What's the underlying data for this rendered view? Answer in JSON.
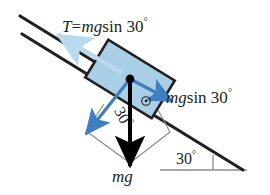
{
  "figure": {
    "name": "inclined-plane-free-body-diagram",
    "background_color": "#ffffff"
  },
  "labels": {
    "tension": {
      "symbol": "T",
      "equals": "=",
      "mass_gravity": "mg",
      "trig": "sin 30",
      "degree": "°",
      "full_text": "T = mg sin 30 °"
    },
    "component_along_incline": {
      "mass_gravity": "mg",
      "trig": "sin 30",
      "degree": "°",
      "full_text": "mg sin 30 °"
    },
    "weight": {
      "full_text": "mg"
    },
    "angle_inner": {
      "value": "30",
      "degree": "°",
      "full_text": "30 °"
    },
    "angle_base": {
      "value": "30",
      "degree": "°",
      "full_text": "30 °"
    }
  },
  "colors": {
    "block_fill": "#a9cfe7",
    "block_stroke": "#231f20",
    "incline_line": "#231f20",
    "weight_arrow": "#000000",
    "tension_arrow": "#b9d9ee",
    "component_arrow": "#3f7fbf",
    "construction_line": "#8d8d8d",
    "baseline": "#8d8d8d",
    "text": "#231f20"
  },
  "geometry": {
    "incline_angle_deg": 30,
    "incline_surface": {
      "x1": 22,
      "y1": 34,
      "x2": 243,
      "y2": 170
    },
    "guide_line": {
      "x1": 20,
      "y1": 16,
      "x2": 112,
      "y2": 72
    },
    "baseline": {
      "x1": 160,
      "y1": 170,
      "x2": 247,
      "y2": 170
    },
    "block_center": {
      "x": 130,
      "y": 79
    },
    "block_width": 78,
    "block_height": 44
  },
  "icons": {
    "right_angle_marker": "right-angle-icon",
    "angle_tick": "angle-tick-icon"
  }
}
